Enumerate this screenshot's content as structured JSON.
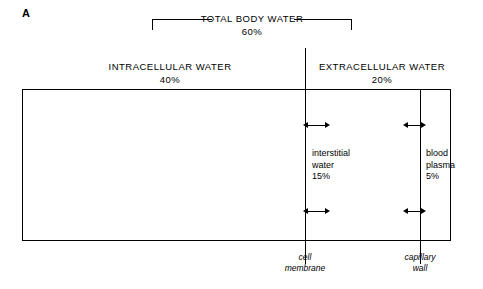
{
  "panel": {
    "letter": "A"
  },
  "diagram": {
    "total_body_water": {
      "title": "TOTAL BODY WATER",
      "value": "60%"
    },
    "intracellular": {
      "title": "INTRACELLULAR WATER",
      "value": "40%"
    },
    "extracellular": {
      "title": "EXTRACELLULAR WATER",
      "value": "20%"
    },
    "interstitial": {
      "title": "interstitial",
      "title2": "water",
      "value": "15%"
    },
    "plasma": {
      "title": "blood",
      "title2": "plasma",
      "value": "5%"
    },
    "cell_membrane_caption": {
      "line1": "cell",
      "line2": "membrane"
    },
    "capillary_wall_caption": {
      "line1": "capillary",
      "line2": "wall"
    }
  },
  "colors": {
    "stroke": "#000000",
    "background": "#ffffff"
  }
}
